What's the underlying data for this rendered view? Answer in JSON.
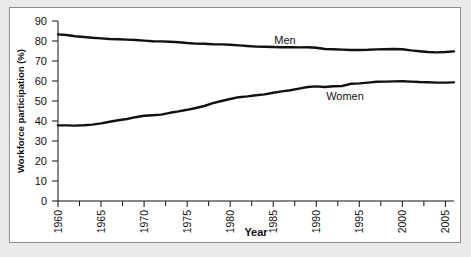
{
  "figure": {
    "background_color": "#e9e9e7",
    "panel_color": "#ffffff",
    "border_color": "#8d8d8d",
    "line_color": "#111111"
  },
  "chart_data": {
    "type": "line",
    "title": "",
    "xlabel": "Year",
    "ylabel": "Workforce participation (%)",
    "xlim": [
      1960,
      2006
    ],
    "ylim": [
      0,
      90
    ],
    "ytick_labels": [
      "90",
      "80",
      "70",
      "60",
      "50",
      "40",
      "30",
      "20",
      "10",
      "0"
    ],
    "ytick_values": [
      90,
      80,
      70,
      60,
      50,
      40,
      30,
      20,
      10,
      0
    ],
    "xtick_labels": [
      "1960",
      "1965",
      "1970",
      "1975",
      "1980",
      "1985",
      "1990",
      "1995",
      "2000",
      "2005"
    ],
    "xtick_values": [
      1960,
      1965,
      1970,
      1975,
      1980,
      1985,
      1990,
      1995,
      2000,
      2005
    ],
    "xminor_values": [
      1962.5,
      1967.5,
      1972.5,
      1977.5,
      1982.5,
      1987.5,
      1992.5,
      1997.5,
      2002.5
    ],
    "grid": false,
    "legend_position": "inline-annotations",
    "x": [
      1960,
      1961,
      1962,
      1963,
      1964,
      1965,
      1966,
      1967,
      1968,
      1969,
      1970,
      1971,
      1972,
      1973,
      1974,
      1975,
      1976,
      1977,
      1978,
      1979,
      1980,
      1981,
      1982,
      1983,
      1984,
      1985,
      1986,
      1987,
      1988,
      1989,
      1990,
      1991,
      1992,
      1993,
      1994,
      1995,
      1996,
      1997,
      1998,
      1999,
      2000,
      2001,
      2002,
      2003,
      2004,
      2005,
      2006
    ],
    "series": [
      {
        "name": "Men",
        "annotation": "Men",
        "values": [
          83.3,
          83.0,
          82.4,
          82.0,
          81.6,
          81.3,
          81.0,
          80.9,
          80.7,
          80.5,
          80.2,
          79.9,
          79.8,
          79.6,
          79.4,
          79.0,
          78.7,
          78.6,
          78.4,
          78.3,
          78.1,
          77.8,
          77.5,
          77.2,
          77.1,
          77.0,
          76.9,
          76.9,
          76.8,
          76.9,
          76.6,
          76.0,
          75.9,
          75.7,
          75.5,
          75.5,
          75.6,
          75.8,
          75.9,
          76.0,
          75.9,
          75.3,
          74.9,
          74.5,
          74.3,
          74.5,
          74.8
        ]
      },
      {
        "name": "Women",
        "annotation": "Women",
        "values": [
          37.8,
          37.8,
          37.7,
          37.9,
          38.2,
          38.8,
          39.6,
          40.4,
          41.0,
          41.9,
          42.6,
          42.9,
          43.2,
          44.1,
          44.8,
          45.6,
          46.5,
          47.5,
          48.9,
          50.0,
          51.0,
          51.9,
          52.3,
          52.9,
          53.3,
          54.1,
          54.8,
          55.4,
          56.2,
          57.0,
          57.3,
          57.0,
          57.4,
          57.5,
          58.6,
          58.8,
          59.2,
          59.6,
          59.7,
          59.8,
          59.9,
          59.7,
          59.5,
          59.4,
          59.2,
          59.2,
          59.3
        ]
      }
    ]
  }
}
